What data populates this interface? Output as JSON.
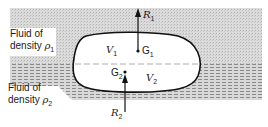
{
  "diagram": {
    "type": "buoyancy-two-fluids",
    "colors": {
      "upper_fluid": "#d4d4d4",
      "lower_fluid": "#bcbcbc",
      "outline": "#111111",
      "background": "#ffffff"
    },
    "upper_fluid": {
      "label_line1": "Fluid of",
      "label_line2": "density ",
      "density_symbol": "ρ",
      "density_sub": "1"
    },
    "lower_fluid": {
      "label_line1": "Fluid of",
      "label_line2": "density ",
      "density_symbol": "ρ",
      "density_sub": "2"
    },
    "body": {
      "upper_volume": {
        "symbol": "V",
        "sub": "1"
      },
      "lower_volume": {
        "symbol": "V",
        "sub": "2"
      },
      "upper_centroid": {
        "symbol": "G",
        "sub": "1"
      },
      "lower_centroid": {
        "symbol": "G",
        "sub": "2"
      }
    },
    "forces": {
      "upper": {
        "symbol": "R",
        "sub": "1"
      },
      "lower": {
        "symbol": "R",
        "sub": "2"
      }
    }
  }
}
